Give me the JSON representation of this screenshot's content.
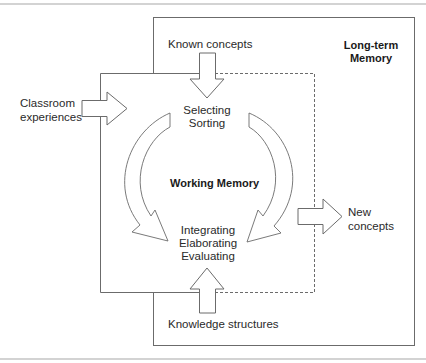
{
  "diagram": {
    "long_term_memory": {
      "label_line1": "Long-term",
      "label_line2": "Memory"
    },
    "working_memory": {
      "label": "Working Memory"
    },
    "inputs": {
      "known_concepts": "Known concepts",
      "classroom_line1": "Classroom",
      "classroom_line2": "experiences",
      "knowledge_structures": "Knowledge structures"
    },
    "processes_top": {
      "line1": "Selecting",
      "line2": "Sorting"
    },
    "processes_bottom": {
      "line1": "Integrating",
      "line2": "Elaborating",
      "line3": "Evaluating"
    },
    "output": {
      "line1": "New",
      "line2": "concepts"
    },
    "colors": {
      "line": "#6b6b6b",
      "rule": "#bdbdbd",
      "text": "#2a2a2a"
    }
  }
}
